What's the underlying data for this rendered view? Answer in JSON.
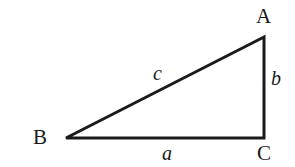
{
  "figure": {
    "kind": "right-triangle-diagram",
    "background_color": "#ffffff",
    "stroke_color": "#1a1a1a",
    "text_color": "#1a1a1a",
    "width": 295,
    "height": 167
  },
  "vertices": [
    {
      "name": "A",
      "label": "A",
      "x": 264,
      "y": 37
    },
    {
      "name": "B",
      "label": "B",
      "x": 66,
      "y": 138
    },
    {
      "name": "C",
      "label": "C",
      "x": 264,
      "y": 138
    }
  ],
  "sides": [
    {
      "name": "a",
      "label": "a",
      "between": "B-C",
      "position": "below-base"
    },
    {
      "name": "b",
      "label": "b",
      "between": "A-C",
      "position": "right-of-vertical"
    },
    {
      "name": "c",
      "label": "c",
      "between": "A-B",
      "position": "above-hypotenuse"
    }
  ],
  "geometry": {
    "path": "M 66 138 L 264 37 L 264 138 Z",
    "stroke_width": 3,
    "right_angle_at": "C"
  }
}
